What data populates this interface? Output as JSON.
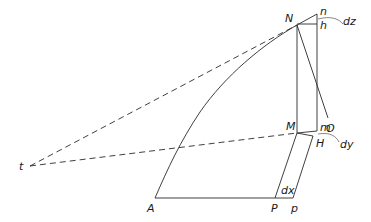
{
  "diagram": {
    "type": "geometric construction (curve with tangents and differential triangle)",
    "labels": {
      "N": "N",
      "n": "n",
      "h": "h",
      "dz": "dz",
      "O": "O",
      "M": "M",
      "m": "m",
      "H": "H",
      "dy": "dy",
      "t": "t",
      "A": "A",
      "P": "P",
      "p": "p",
      "dx": "dx"
    },
    "colors": {
      "stroke": "#2a2a2a",
      "background": "#ffffff"
    }
  }
}
